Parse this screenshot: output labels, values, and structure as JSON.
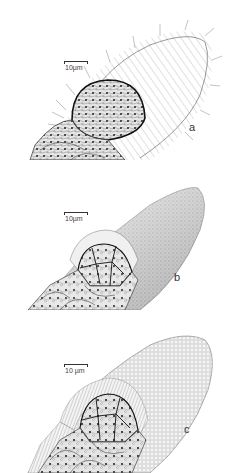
{
  "figure": {
    "panels": [
      {
        "id": "a",
        "label": "a",
        "scale_bar": "10µm",
        "description": "Ciliated elongated structure with dark-outlined cluster of cells at base"
      },
      {
        "id": "b",
        "label": "b",
        "scale_bar": "10µm",
        "description": "Stippled tapering cone with exposed polygonal cell cluster"
      },
      {
        "id": "c",
        "label": "c",
        "scale_bar": "10 µm",
        "description": "Reticulated tapering cone with radial striated border around cell cluster"
      }
    ]
  }
}
